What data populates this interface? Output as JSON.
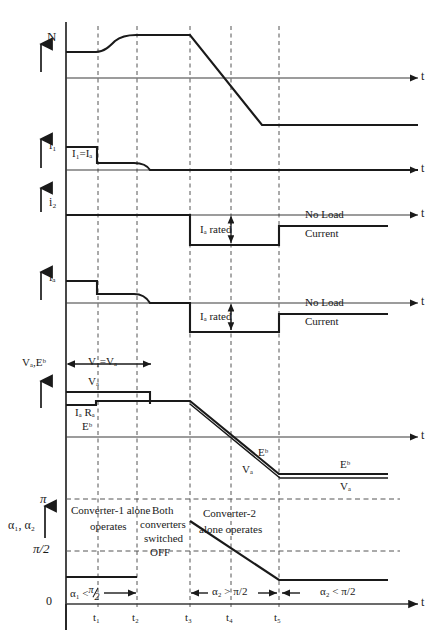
{
  "figure": {
    "type": "waveform-timing-diagram",
    "axis_time_label": "t",
    "time_markers": [
      {
        "id": "t1",
        "label": "t₁",
        "x": 98
      },
      {
        "id": "t2",
        "label": "t₂",
        "x": 137
      },
      {
        "id": "t3",
        "label": "t₃",
        "x": 190
      },
      {
        "id": "t4",
        "label": "t₄",
        "x": 231
      },
      {
        "id": "t5",
        "label": "t₅",
        "x": 279
      }
    ]
  },
  "panels": [
    {
      "id": "speed",
      "y_label": "N",
      "t_label": "t",
      "description": "Motor speed rises to set value, held, then ramps down through zero to negative (reverse) speed"
    },
    {
      "id": "converter1-current",
      "y_label": "i₁",
      "t_label": "t",
      "inline_label": "I₁=Iₐ",
      "description": "Converter-1 current: rated block up to t1, reduced level to t2, decays to zero"
    },
    {
      "id": "converter2-current",
      "y_label": "i₂",
      "t_label": "t",
      "rated_label": "Iₐ rated",
      "no_load_label_line1": "No Load",
      "no_load_label_line2": "Current",
      "description": "Converter-2 current: zero until t3, negative rated block t3-t5, then small no-load current"
    },
    {
      "id": "armature-current",
      "y_label": "iₐ",
      "t_label": "t",
      "rated_label": "Iₐ rated",
      "no_load_label_line1": "No Load",
      "no_load_label_line2": "Current",
      "description": "Net armature current: positive rated, step down, decay to zero, negative rated block, then no-load"
    },
    {
      "id": "voltage",
      "y_label": "Vₐ,Eᵇ",
      "t_label": "t",
      "span_label": "V₁=Vₐ",
      "trace_labels": {
        "va_top": "Vₐ",
        "iara": "Iₐ Rₐ",
        "eb_left": "Eᵇ",
        "eb_mid": "Eᵇ",
        "va_mid": "Vₐ",
        "eb_right": "Eᵇ",
        "va_right": "Vₐ"
      },
      "description": "Armature voltage and back-emf; both ramp negative after t3 and settle at reverse values"
    },
    {
      "id": "firing-angle",
      "y_label": "α₁, α₂",
      "t_label": "t",
      "y_ticks": [
        {
          "label": "π",
          "value": "pi"
        },
        {
          "label": "π/2",
          "value": "pi/2"
        },
        {
          "label": "0",
          "value": "0"
        }
      ],
      "regions": [
        {
          "id": "region-1",
          "line1": "Converter-1 alone",
          "line2": "operates"
        },
        {
          "id": "region-2",
          "line1": "Both",
          "line2": "converters",
          "line3": "switched",
          "line4": "OFF"
        },
        {
          "id": "region-3",
          "line1": "Converter-2",
          "line2": "alone operates"
        }
      ],
      "annotations": [
        {
          "id": "alpha1-range",
          "text_pre": "α₁ <",
          "text_frac": "π/2"
        },
        {
          "id": "alpha2-gt",
          "text": "α₂ > π/2"
        },
        {
          "id": "alpha2-lt",
          "text": "α₂ < π/2"
        }
      ]
    }
  ],
  "colors": {
    "ink": "#1a1a1a",
    "axis": "#3a3a3a",
    "dashed": "#555555",
    "background": "#ffffff"
  }
}
